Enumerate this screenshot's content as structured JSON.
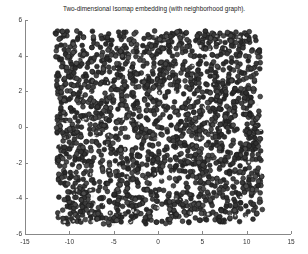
{
  "chart_data": {
    "type": "scatter",
    "title": "Two-dimensional Isomap embedding (with neighborhood graph).",
    "xlabel": "",
    "ylabel": "",
    "xlim": [
      -15,
      15
    ],
    "ylim": [
      -6,
      6
    ],
    "xticks": [
      -15,
      -10,
      -5,
      0,
      5,
      10,
      15
    ],
    "yticks": [
      -6,
      -4,
      -2,
      0,
      2,
      4,
      6
    ],
    "xtick_labels": [
      "-15",
      "-10",
      "-5",
      "0",
      "5",
      "10",
      "15"
    ],
    "ytick_labels": [
      "-6",
      "-4",
      "-2",
      "0",
      "2",
      "4",
      "6"
    ],
    "grid": false,
    "legend": null,
    "marker": "circle (open, dense)",
    "series": [
      {
        "name": "embedded points",
        "description": "Dense uniform cloud of points filling an approximately square region, slightly rotated",
        "region_corners": {
          "top_left": [
            -11.6,
            5.4
          ],
          "top_right": [
            11.5,
            5.4
          ],
          "bottom_right": [
            11.8,
            -5.3
          ],
          "bottom_left": [
            -11.3,
            -5.6
          ]
        },
        "approx_point_count": 2000,
        "color": "#3a3a3a"
      }
    ]
  },
  "style": {
    "axis_color": "#888888",
    "point_color": "#3a3a3a",
    "point_edge_color": "#1a1a1a",
    "background": "#ffffff"
  }
}
